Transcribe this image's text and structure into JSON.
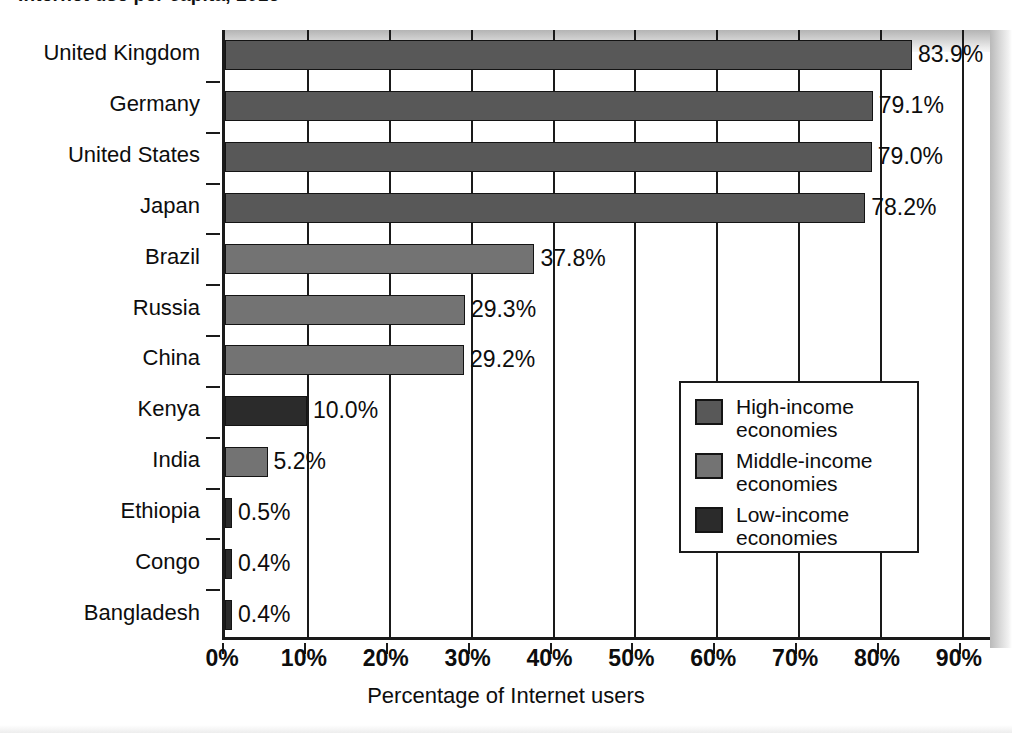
{
  "title": "Internet use per capita, 2016",
  "xaxis_title": "Percentage of Internet users",
  "xticks": [
    "0%",
    "10%",
    "20%",
    "30%",
    "40%",
    "50%",
    "60%",
    "70%",
    "80%",
    "90%"
  ],
  "legend": {
    "items": [
      {
        "label_line1": "High-income",
        "label_line2": "economies",
        "swatch": "high",
        "color": "#585858"
      },
      {
        "label_line1": "Middle-income",
        "label_line2": "economies",
        "swatch": "middle",
        "color": "#737373"
      },
      {
        "label_line1": "Low-income",
        "label_line2": "economies",
        "swatch": "low",
        "color": "#2b2b2b"
      }
    ]
  },
  "chart_data": {
    "type": "bar",
    "orientation": "horizontal",
    "title": "Internet use per capita, 2016",
    "xlabel": "Percentage of Internet users",
    "ylabel": "",
    "xlim": [
      0,
      93.8
    ],
    "xticks": [
      0,
      10,
      20,
      30,
      40,
      50,
      60,
      70,
      80,
      90
    ],
    "grid": true,
    "legend_position": "inside-right",
    "categories": [
      "United Kingdom",
      "Germany",
      "United States",
      "Japan",
      "Brazil",
      "Russia",
      "China",
      "Kenya",
      "India",
      "Ethiopia",
      "Congo",
      "Bangladesh"
    ],
    "values": [
      83.9,
      79.1,
      79.0,
      78.2,
      37.8,
      29.3,
      29.2,
      10.0,
      5.2,
      0.5,
      0.4,
      0.4
    ],
    "data_labels": [
      "83.9%",
      "79.1%",
      "79.0%",
      "78.2%",
      "37.8%",
      "29.3%",
      "29.2%",
      "10.0%",
      "5.2%",
      "0.5%",
      "0.4%",
      "0.4%"
    ],
    "groups": [
      "high",
      "high",
      "high",
      "high",
      "middle",
      "middle",
      "middle",
      "low",
      "middle",
      "low",
      "low",
      "low"
    ],
    "group_names": {
      "high": "High-income economies",
      "middle": "Middle-income economies",
      "low": "Low-income economies"
    },
    "series": [
      {
        "name": "Percentage of Internet users",
        "points": [
          {
            "category": "United Kingdom",
            "value": 83.9,
            "label": "83.9%",
            "group": "high"
          },
          {
            "category": "Germany",
            "value": 79.1,
            "label": "79.1%",
            "group": "high"
          },
          {
            "category": "United States",
            "value": 79.0,
            "label": "79.0%",
            "group": "high"
          },
          {
            "category": "Japan",
            "value": 78.2,
            "label": "78.2%",
            "group": "high"
          },
          {
            "category": "Brazil",
            "value": 37.8,
            "label": "37.8%",
            "group": "middle"
          },
          {
            "category": "Russia",
            "value": 29.3,
            "label": "29.3%",
            "group": "middle"
          },
          {
            "category": "China",
            "value": 29.2,
            "label": "29.2%",
            "group": "middle"
          },
          {
            "category": "Kenya",
            "value": 10.0,
            "label": "10.0%",
            "group": "low"
          },
          {
            "category": "India",
            "value": 5.2,
            "label": "5.2%",
            "group": "middle"
          },
          {
            "category": "Ethiopia",
            "value": 0.5,
            "label": "0.5%",
            "group": "low"
          },
          {
            "category": "Congo",
            "value": 0.4,
            "label": "0.4%",
            "group": "low"
          },
          {
            "category": "Bangladesh",
            "value": 0.4,
            "label": "0.4%",
            "group": "low"
          }
        ]
      }
    ]
  },
  "colors": {
    "high_income": "#585858",
    "middle_income": "#737373",
    "low_income": "#2b2b2b",
    "axis": "#1a1a1a",
    "text": "#0d0d0d",
    "background": "#ffffff"
  }
}
